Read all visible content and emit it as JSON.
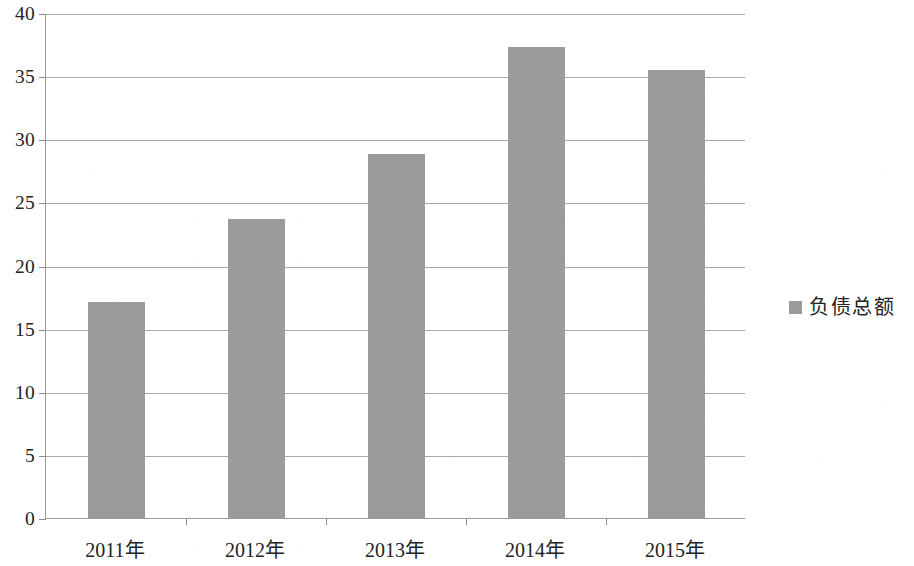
{
  "chart_data": {
    "type": "bar",
    "title": "",
    "subtitle": "",
    "xlabel": "",
    "ylabel": "",
    "categories": [
      "2011年",
      "2012年",
      "2013年",
      "2014年",
      "2015年"
    ],
    "series": [
      {
        "name": "负债总额",
        "values": [
          17.1,
          23.7,
          28.8,
          37.3,
          35.5
        ],
        "color": "#9b9b9b"
      }
    ],
    "values": [
      17.1,
      23.7,
      28.8,
      37.3,
      35.5
    ],
    "ylim": [
      0,
      40
    ],
    "yticks": [
      0,
      5,
      10,
      15,
      20,
      25,
      30,
      35,
      40
    ],
    "ytick_labels": [
      "0",
      "5",
      "10",
      "15",
      "20",
      "25",
      "30",
      "35",
      "40"
    ],
    "grid": "horizontal",
    "grid_color": "#a8a8a8",
    "axis_color": "#9a9a9a",
    "background": "#ffffff",
    "legend": {
      "position": "right",
      "entries": [
        {
          "label": "负债总额",
          "marker": "square-swatch",
          "color": "#9b9b9b"
        }
      ]
    }
  }
}
